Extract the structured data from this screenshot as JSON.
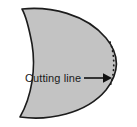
{
  "figure": {
    "background_color": "#ffffff",
    "shape": {
      "name": "tapered-rounded-blank",
      "fill_color": "#c3c3c3",
      "outline_color": "#1c1c1c",
      "outline_width": 1.6
    },
    "cut_guide": {
      "name": "dotted-cut-arc",
      "style": "dotted",
      "color": "#1c1c1c",
      "dot_count": 12
    },
    "annotation": {
      "label": "Cutting line",
      "text_color": "#1a1a1a",
      "arrow": {
        "name": "arrow-pointing-right",
        "direction": "right",
        "color": "#111111"
      }
    }
  }
}
